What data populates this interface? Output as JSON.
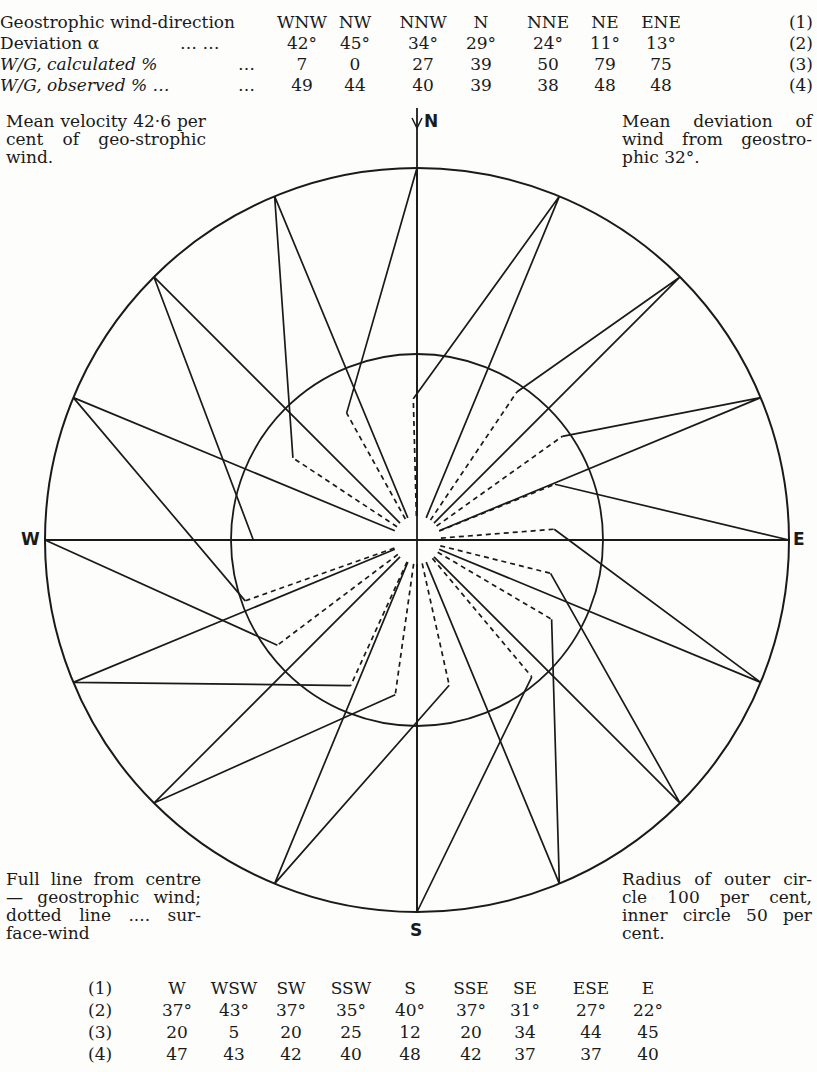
{
  "top_table": {
    "header_label": "Geostrophic wind-direction",
    "rows": [
      {
        "label": "Geostrophic wind-direction",
        "dots": "",
        "index": "(1)",
        "values": [
          "WNW",
          "NW",
          "NNW",
          "N",
          "NNE",
          "NE",
          "ENE"
        ]
      },
      {
        "label": "Deviation α",
        "dots": "…          …",
        "index": "(2)",
        "values": [
          "42°",
          "45°",
          "34°",
          "29°",
          "24°",
          "11°",
          "13°"
        ]
      },
      {
        "label": "W/G, calculated %",
        "dots": "…",
        "index": "(3)",
        "values": [
          "7",
          "0",
          "27",
          "39",
          "50",
          "79",
          "75"
        ]
      },
      {
        "label": "W/G, observed % …",
        "dots": "…",
        "index": "(4)",
        "values": [
          "49",
          "44",
          "40",
          "39",
          "38",
          "48",
          "48"
        ]
      }
    ]
  },
  "bottom_table": {
    "rows": [
      {
        "index": "(1)",
        "values": [
          "W",
          "WSW",
          "SW",
          "SSW",
          "S",
          "SSE",
          "SE",
          "ESE",
          "E"
        ]
      },
      {
        "index": "(2)",
        "values": [
          "37°",
          "43°",
          "37°",
          "35°",
          "40°",
          "37°",
          "31°",
          "27°",
          "22°"
        ]
      },
      {
        "index": "(3)",
        "values": [
          "20",
          "5",
          "20",
          "25",
          "12",
          "20",
          "34",
          "44",
          "45"
        ]
      },
      {
        "index": "(4)",
        "values": [
          "47",
          "43",
          "42",
          "40",
          "48",
          "42",
          "37",
          "37",
          "40"
        ]
      }
    ]
  },
  "notes": {
    "top_left": "Mean velocity 42·6 per cent of geo-strophic wind.",
    "top_right": "Mean deviation of wind from geostro-phic 32°.",
    "bottom_left": "Full line from centre — geostrophic wind; dotted line .... sur-face-wind",
    "bottom_right": "Radius of outer cir-cle 100 per cent, inner circle 50 per cent."
  },
  "compass": {
    "N": "N",
    "S": "S",
    "E": "E",
    "W": "W"
  },
  "diagram": {
    "center": [
      417,
      540
    ],
    "outer_radius_percent": 100,
    "inner_radius_percent": 50,
    "line_color": "#1a1a1a",
    "directions": [
      {
        "dir": "N",
        "bearing": 0,
        "deviation": 29,
        "observed": 39
      },
      {
        "dir": "NNE",
        "bearing": 22.5,
        "deviation": 24,
        "observed": 38
      },
      {
        "dir": "NE",
        "bearing": 45,
        "deviation": 11,
        "observed": 48
      },
      {
        "dir": "ENE",
        "bearing": 67.5,
        "deviation": 13,
        "observed": 48
      },
      {
        "dir": "E",
        "bearing": 90,
        "deviation": 22,
        "observed": 40
      },
      {
        "dir": "ESE",
        "bearing": 112.5,
        "deviation": 27,
        "observed": 37
      },
      {
        "dir": "SE",
        "bearing": 135,
        "deviation": 31,
        "observed": 37
      },
      {
        "dir": "SSE",
        "bearing": 157.5,
        "deviation": 37,
        "observed": 42
      },
      {
        "dir": "S",
        "bearing": 180,
        "deviation": 40,
        "observed": 48
      },
      {
        "dir": "SSW",
        "bearing": 202.5,
        "deviation": 35,
        "observed": 40
      },
      {
        "dir": "SW",
        "bearing": 225,
        "deviation": 37,
        "observed": 42
      },
      {
        "dir": "WSW",
        "bearing": 247.5,
        "deviation": 43,
        "observed": 43
      },
      {
        "dir": "W",
        "bearing": 270,
        "deviation": 37,
        "observed": 47
      },
      {
        "dir": "WNW",
        "bearing": 292.5,
        "deviation": 42,
        "observed": 49
      },
      {
        "dir": "NW",
        "bearing": 315,
        "deviation": 45,
        "observed": 44
      },
      {
        "dir": "NNW",
        "bearing": 337.5,
        "deviation": 34,
        "observed": 40
      }
    ]
  }
}
